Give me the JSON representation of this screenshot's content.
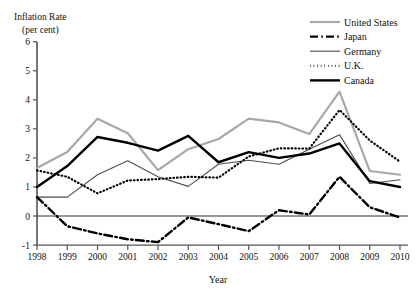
{
  "chart_data": {
    "type": "line",
    "title": "",
    "ylabel_line1": "Inflation Rate",
    "ylabel_line2": "(per cent)",
    "xlabel": "Year",
    "categories": [
      "1998",
      "1999",
      "2000",
      "2001",
      "2002",
      "2003",
      "2004",
      "2005",
      "2006",
      "2007",
      "2008",
      "2009",
      "2010"
    ],
    "x": [
      1998,
      1999,
      2000,
      2001,
      2002,
      2003,
      2004,
      2005,
      2006,
      2007,
      2008,
      2009,
      2010
    ],
    "xlim": [
      1998,
      2010
    ],
    "ylim": [
      -1,
      6
    ],
    "yticks": [
      "6",
      "5",
      "4",
      "3",
      "2",
      "1",
      "0",
      "-1"
    ],
    "ytick_values": [
      6,
      5,
      4,
      3,
      2,
      1,
      0,
      -1
    ],
    "grid": false,
    "zero_line": true,
    "legend_position": "top-right",
    "series": [
      {
        "name": "United States",
        "style": "solid-gray",
        "color": "#a8a8a8",
        "width": 2.2,
        "values": [
          1.65,
          2.2,
          3.35,
          2.85,
          1.58,
          2.3,
          2.65,
          3.35,
          3.22,
          2.82,
          4.28,
          1.55,
          1.42
        ]
      },
      {
        "name": "Japan",
        "style": "dash-dot-black",
        "color": "#000000",
        "width": 2.4,
        "values": [
          0.65,
          -0.35,
          -0.6,
          -0.8,
          -0.9,
          -0.05,
          -0.28,
          -0.52,
          0.2,
          0.05,
          1.35,
          0.3,
          -0.05
        ]
      },
      {
        "name": "Germany",
        "style": "thin-gray",
        "color": "#4d4d4d",
        "width": 1.1,
        "values": [
          0.65,
          0.65,
          1.42,
          1.9,
          1.35,
          1.02,
          1.78,
          1.92,
          1.78,
          2.3,
          2.8,
          1.12,
          1.25
        ]
      },
      {
        "name": "U.K.",
        "style": "dotted-black",
        "color": "#000000",
        "width": 2.2,
        "values": [
          1.57,
          1.35,
          0.78,
          1.22,
          1.27,
          1.35,
          1.32,
          2.05,
          2.33,
          2.32,
          3.65,
          2.6,
          1.87
        ]
      },
      {
        "name": "Canada",
        "style": "thick-black",
        "color": "#000000",
        "width": 2.4,
        "values": [
          1.0,
          1.72,
          2.72,
          2.52,
          2.25,
          2.76,
          1.85,
          2.2,
          2.0,
          2.15,
          2.5,
          1.2,
          1.0
        ]
      }
    ]
  }
}
